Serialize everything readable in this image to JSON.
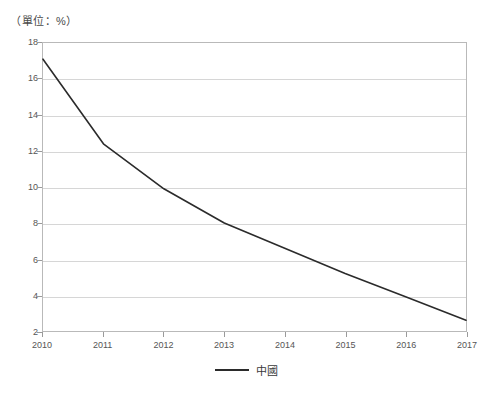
{
  "unit_label": "（單位：%）",
  "legend": {
    "position": "bottom-center",
    "entries": [
      {
        "label": "中國",
        "color": "#2b2b2b"
      }
    ]
  },
  "chart_data": {
    "type": "line",
    "title": "",
    "subtitle": "",
    "unit_note": "（單位：%）",
    "xlabel": "",
    "ylabel": "",
    "x": [
      2010,
      2011,
      2012,
      2013,
      2014,
      2015,
      2016,
      2017
    ],
    "xtick_labels": [
      "2010",
      "2011",
      "2012",
      "2013",
      "2014",
      "2015",
      "2016",
      "2017"
    ],
    "ytick_labels": [
      "2",
      "4",
      "6",
      "8",
      "10",
      "12",
      "14",
      "16",
      "18"
    ],
    "yticks": [
      2,
      4,
      6,
      8,
      10,
      12,
      14,
      16,
      18
    ],
    "ylim": [
      2,
      18
    ],
    "xlim": [
      2010,
      2017
    ],
    "grid": "horizontal",
    "series": [
      {
        "name": "中國",
        "color": "#2b2b2b",
        "values": [
          17.1,
          12.4,
          9.9,
          8.0,
          6.6,
          5.2,
          3.9,
          2.6
        ]
      }
    ]
  }
}
